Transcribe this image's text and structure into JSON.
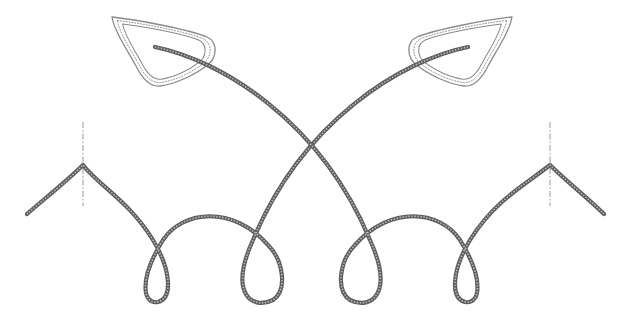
{
  "figure": {
    "colors": {
      "background": "#ffffff",
      "rope": "#5e5e5e",
      "rope_highlight": "#bdbdbd",
      "leaf_outline": "#8a8a8a",
      "centerline": "#9a9a9a"
    },
    "elements": {
      "leaf_left": {
        "label": "left-leaf",
        "path": "M112,17 C140,20 190,30 207,37 C218,42 218,58 206,66 C196,74 176,84 160,86 C150,87 142,78 136,66 C126,48 114,30 112,17 Z"
      },
      "leaf_right": {
        "label": "right-leaf",
        "path": "M512,17 C484,20 434,30 417,37 C406,42 406,58 418,66 C428,74 448,84 464,86 C474,87 482,78 488,66 C498,48 510,30 512,17 Z"
      },
      "rope_left": {
        "label": "left-rope",
        "path": "M155,47 C220,60 320,120 370,240 C395,295 370,310 350,300 C335,290 340,260 355,245 C390,205 440,210 460,240 C485,280 480,305 465,302 C450,298 452,270 470,240 C495,200 525,185 550,165 C565,180 590,200 604,214"
      },
      "rope_right": {
        "label": "right-rope",
        "path": "M468,47 C403,60 303,120 253,240 C228,295 253,310 273,300 C288,290 283,260 268,245 C233,205 183,210 163,240 C138,280 143,305 158,302 C173,298 171,270 153,240 C128,200 98,185 83,165 C68,180 43,200 27,214"
      },
      "centerline_left": {
        "label": "left-centerline",
        "x": 83,
        "y1": 122,
        "y2": 206
      },
      "centerline_right": {
        "label": "right-centerline",
        "x": 550,
        "y1": 122,
        "y2": 206
      }
    }
  }
}
